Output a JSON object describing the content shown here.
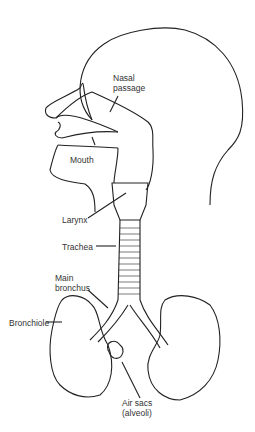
{
  "diagram": {
    "labels": {
      "nasal_line1": "Nasal",
      "nasal_line2": "passage",
      "mouth": "Mouth",
      "larynx": "Larynx",
      "trachea": "Trachea",
      "bronchus_line1": "Main",
      "bronchus_line2": "bronchus",
      "bronchiole": "Bronchiole",
      "airsacs_line1": "Air sacs",
      "airsacs_line2": "(alveoli)"
    },
    "colors": {
      "line": "#222222",
      "text": "#333333",
      "background": "#ffffff"
    }
  }
}
